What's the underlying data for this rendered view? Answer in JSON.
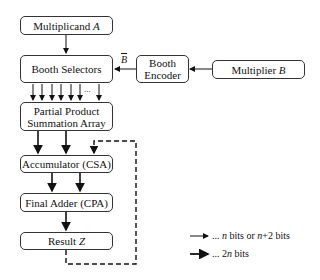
{
  "nodes": {
    "multiplicand": {
      "label": "Multiplicand",
      "var": "A"
    },
    "booth_selectors": {
      "label": "Booth Selectors"
    },
    "booth_encoder": {
      "line1": "Booth",
      "line2": "Encoder"
    },
    "multiplier": {
      "label": "Multiplier",
      "var": "B"
    },
    "pp_array": {
      "line1": "Partial Product",
      "line2": "Summation Array"
    },
    "accumulator": {
      "label": "Accumulator (CSA)"
    },
    "final_adder": {
      "label": "Final Adder (CPA)"
    },
    "result": {
      "label": "Result",
      "var": "Z"
    }
  },
  "edge_labels": {
    "b_tilde": "B",
    "ellipsis": "..."
  },
  "legend": {
    "thin": {
      "prefix": "... ",
      "n1": "n",
      "mid": " bits or ",
      "n2": "n",
      "suffix": "+2 bits"
    },
    "thick": {
      "prefix": "... 2",
      "n": "n",
      "suffix": " bits"
    }
  }
}
